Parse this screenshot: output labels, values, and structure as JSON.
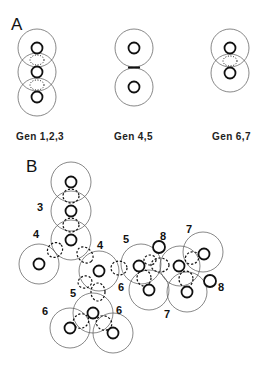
{
  "panels": {
    "A": {
      "letter": "A",
      "groups": [
        {
          "label": "Gen 1,2,3"
        },
        {
          "label": "Gen  4,5"
        },
        {
          "label": "Gen  6,7"
        }
      ]
    },
    "B": {
      "letter": "B",
      "numbers": [
        "3",
        "4",
        "4",
        "5",
        "8",
        "7",
        "6",
        "8",
        "7",
        "5",
        "6",
        "6"
      ]
    }
  },
  "colors": {
    "stroke": "#111111",
    "outer_stroke": "#555555",
    "background": "#ffffff"
  }
}
